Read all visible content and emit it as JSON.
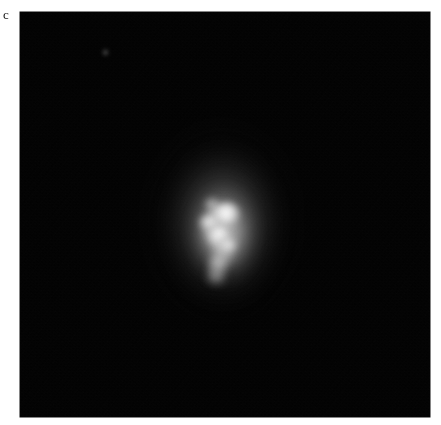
{
  "figure": {
    "background_color": "#ffffff",
    "width_px": 441,
    "height_px": 425
  },
  "panel": {
    "label": "c",
    "label_color": "#1a1a1a",
    "background_color": "#000000",
    "bounds_px": {
      "left": 20,
      "top": 12,
      "width": 410,
      "height": 405
    },
    "colormap": "grayscale",
    "description_alt": "Grayscale astronomical image of a compact, vertically elongated nebulous object with a bright irregular zig-zag core on a black background"
  },
  "object": {
    "name": "central-source",
    "center_px": {
      "x": 222,
      "y": 222
    },
    "halo_extent_px": {
      "width": 190,
      "height": 240
    },
    "core_extent_px": {
      "width": 44,
      "height": 90
    },
    "core_shape": "zig-zag / S-shaped chain of bright knots",
    "peak_color": "#ffffff",
    "halo_color": "#9a9a9a",
    "knots": [
      {
        "id": "k1",
        "label": "upper bright knot",
        "x": 222,
        "y": 212,
        "relative_brightness": 1.0
      },
      {
        "id": "k2",
        "label": "left lobe",
        "x": 208,
        "y": 222,
        "relative_brightness": 0.88
      },
      {
        "id": "k3",
        "label": "central bridge",
        "x": 218,
        "y": 233,
        "relative_brightness": 0.94
      },
      {
        "id": "k4",
        "label": "lower-right knot",
        "x": 228,
        "y": 244,
        "relative_brightness": 0.86
      },
      {
        "id": "k5",
        "label": "tail knot",
        "x": 218,
        "y": 262,
        "relative_brightness": 0.66
      },
      {
        "id": "k6",
        "label": "lowest faint knot",
        "x": 216,
        "y": 276,
        "relative_brightness": 0.48
      },
      {
        "id": "k7",
        "label": "small upper knot",
        "x": 211,
        "y": 205,
        "relative_brightness": 0.62
      }
    ]
  },
  "point_source": {
    "label": "faint point source",
    "x": 105,
    "y": 52,
    "relative_brightness": 0.12
  }
}
